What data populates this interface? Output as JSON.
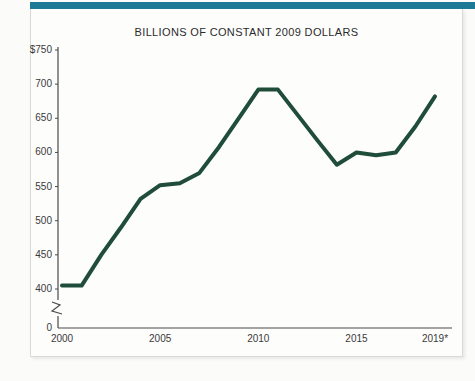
{
  "chart_data": {
    "type": "line",
    "title": "BILLIONS OF CONSTANT 2009 DOLLARS",
    "xlabel": "",
    "ylabel": "",
    "grid": false,
    "legend": "none",
    "axis_break": true,
    "axis_break_note": "y-axis broken between 0 and 400",
    "ylim": [
      400,
      750
    ],
    "yticks": [
      "$750",
      "700",
      "650",
      "600",
      "550",
      "500",
      "450",
      "400",
      "0"
    ],
    "ytick_values": [
      750,
      700,
      650,
      600,
      550,
      500,
      450,
      400,
      0
    ],
    "xlim": [
      2000,
      2019
    ],
    "xticks": [
      "2000",
      "2005",
      "2010",
      "2015",
      "2019*"
    ],
    "xtick_values": [
      2000,
      2005,
      2010,
      2015,
      2019
    ],
    "x": [
      2000,
      2001,
      2002,
      2003,
      2004,
      2005,
      2006,
      2007,
      2008,
      2009,
      2010,
      2011,
      2012,
      2013,
      2014,
      2015,
      2016,
      2017,
      2018,
      2019
    ],
    "values": [
      405,
      405,
      450,
      490,
      532,
      552,
      555,
      570,
      608,
      650,
      692,
      692,
      655,
      618,
      582,
      600,
      596,
      600,
      638,
      682
    ],
    "series": [
      {
        "name": "Billions of constant 2009 dollars",
        "color": "#1f4d3a",
        "values": [
          405,
          405,
          450,
          490,
          532,
          552,
          555,
          570,
          608,
          650,
          692,
          692,
          655,
          618,
          582,
          600,
          596,
          600,
          638,
          682
        ]
      }
    ],
    "colors": {
      "line": "#1f4d3a",
      "axis": "#4a4a4a",
      "accent_rule": "#1d7a96",
      "card_background": "#fdfdfc",
      "page_background": "#fbfbfa"
    }
  }
}
